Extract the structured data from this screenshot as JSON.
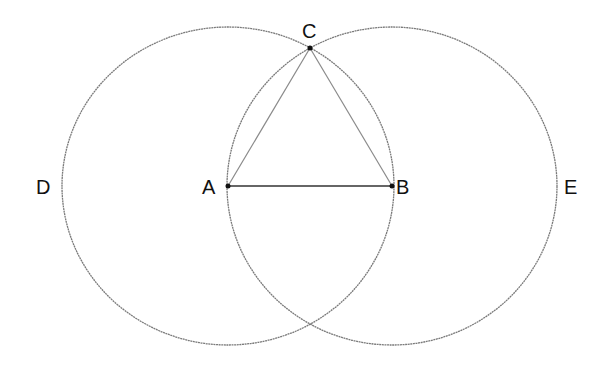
{
  "diagram": {
    "colors": {
      "circle": "#7a7a7a",
      "triangle_side": "#8a8a8a",
      "base": "#333333",
      "label": "#111111"
    },
    "points": {
      "A": {
        "label": "A",
        "x": 228,
        "y": 186
      },
      "B": {
        "label": "B",
        "x": 392,
        "y": 186
      },
      "C": {
        "label": "C",
        "x": 310,
        "y": 48
      }
    },
    "labels": {
      "A": "A",
      "B": "B",
      "C": "C",
      "D": "D",
      "E": "E"
    },
    "circles": [
      {
        "name": "circle-centered-A",
        "center": "A",
        "through": "B",
        "label": "D"
      },
      {
        "name": "circle-centered-B",
        "center": "B",
        "through": "A",
        "label": "E"
      }
    ],
    "segments": [
      {
        "from": "A",
        "to": "B",
        "kind": "base"
      },
      {
        "from": "A",
        "to": "C",
        "kind": "side"
      },
      {
        "from": "B",
        "to": "C",
        "kind": "side"
      }
    ]
  }
}
